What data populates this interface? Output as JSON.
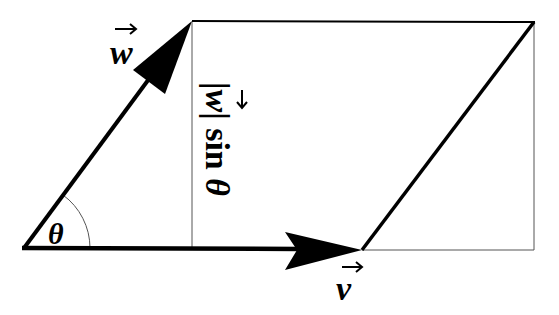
{
  "diagram": {
    "labels": {
      "vector_w": "w",
      "vector_v": "v",
      "angle": "θ",
      "height_prefix": "|",
      "height_w": "w",
      "height_suffix": "| sin ",
      "height_theta": "θ"
    },
    "points": {
      "origin": [
        24,
        248
      ],
      "w_tip": [
        192,
        21
      ],
      "v_tip": [
        362,
        250
      ],
      "far_corner": [
        534,
        22
      ]
    },
    "colors": {
      "stroke": "#000000",
      "thin_stroke": "#555555",
      "background": "#ffffff"
    }
  }
}
